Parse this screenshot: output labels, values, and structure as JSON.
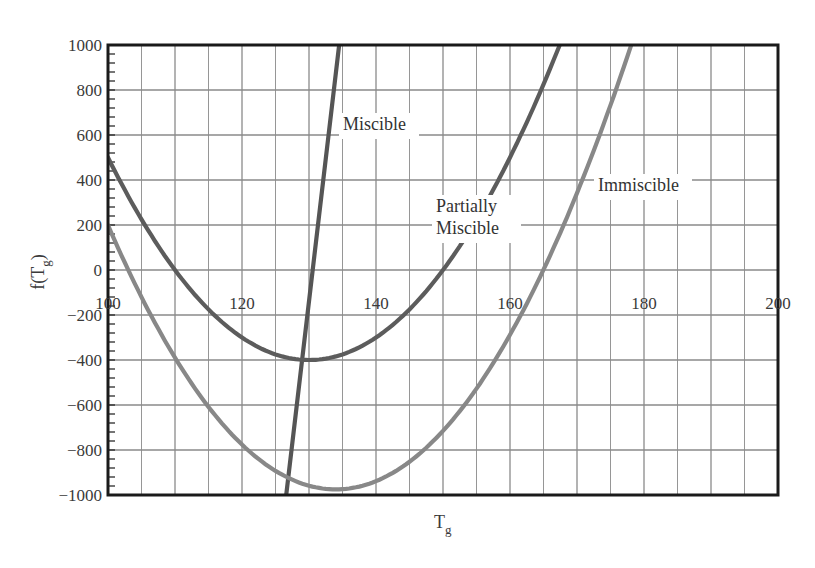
{
  "chart_data": {
    "type": "line",
    "title": "",
    "xlabel": "T",
    "xlabel_sub": "g",
    "ylabel": "f(T",
    "ylabel_sub": "g",
    "ylabel_close": ")",
    "xlim": [
      100,
      200
    ],
    "ylim": [
      -1000,
      1000
    ],
    "x_ticks": [
      100,
      120,
      140,
      160,
      180,
      200
    ],
    "y_ticks": [
      1000,
      800,
      600,
      400,
      200,
      0,
      -200,
      -400,
      -600,
      -800,
      -1000
    ],
    "y_tick_labels": [
      "1000",
      "800",
      "600",
      "400",
      "200",
      "0",
      "−200",
      "−400",
      "−600",
      "−800",
      "−1000"
    ],
    "x_grid_step": 5,
    "y_grid_step": 200,
    "y_minor_step": 40,
    "grid": true,
    "legend": "inline-labels",
    "series": [
      {
        "name": "Miscible",
        "kind": "linear",
        "points": [
          [
            126.6,
            -1000
          ],
          [
            134.5,
            1000
          ]
        ],
        "color": "#555555",
        "label_lines": [
          "Miscible"
        ],
        "label_pos": [
          343,
          130
        ]
      },
      {
        "name": "Partially Miscible",
        "kind": "parabola",
        "vertex": [
          130,
          -400
        ],
        "a": 1.0,
        "x": [
          100,
          110,
          120,
          130,
          140,
          150,
          160,
          167.4
        ],
        "values": [
          500,
          0,
          -300,
          -400,
          -300,
          0,
          500,
          1000
        ],
        "color": "#5c5c5c",
        "label_lines": [
          "Partially",
          "Miscible"
        ],
        "label_pos": [
          436,
          212
        ]
      },
      {
        "name": "Immiscible",
        "kind": "parabola",
        "vertex": [
          134,
          -975
        ],
        "a": 1.016,
        "x": [
          100,
          110,
          120,
          134,
          150,
          160,
          170,
          178.1
        ],
        "values": [
          200,
          -390,
          -776,
          -975,
          -715,
          -288,
          342,
          1000
        ],
        "color": "#888888",
        "label_lines": [
          "Immiscible"
        ],
        "label_pos": [
          598,
          191
        ]
      }
    ]
  },
  "colors": {
    "axis": "#1a1a1a",
    "grid": "#8a8a8a",
    "background": "#ffffff"
  }
}
